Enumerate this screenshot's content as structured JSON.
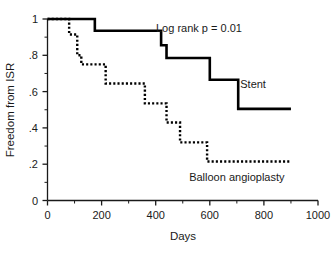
{
  "chart_data": {
    "type": "line",
    "subtype": "kaplan-meier-step",
    "title": "",
    "xlabel": "Days",
    "ylabel": "Freedom from ISR",
    "xlim": [
      0,
      1000
    ],
    "ylim": [
      0,
      1
    ],
    "grid": false,
    "legend_position": "inline-annotation",
    "xticks": [
      0,
      200,
      400,
      600,
      800,
      1000
    ],
    "xtick_labels": [
      "0",
      "200",
      "400",
      "600",
      "800",
      "1000"
    ],
    "xminor_ticks": [
      100,
      300,
      500,
      700,
      900
    ],
    "yticks": [
      0,
      0.2,
      0.4,
      0.6,
      0.8,
      1
    ],
    "ytick_labels": [
      "0",
      ".2",
      ".4",
      ".6",
      ".8",
      "1"
    ],
    "yminor_ticks": [
      0.1,
      0.3,
      0.5,
      0.7,
      0.9
    ],
    "annotations": [
      {
        "name": "log-rank-p",
        "text": "Log rank p = 0.01",
        "x": 560,
        "y": 0.93
      },
      {
        "name": "stent-label",
        "text": "Stent",
        "x": 760,
        "y": 0.62
      },
      {
        "name": "balloon-label",
        "text": "Balloon angioplasty",
        "x": 700,
        "y": 0.11
      }
    ],
    "series": [
      {
        "name": "Stent",
        "style": "solid",
        "color": "#000000",
        "points": [
          {
            "x": 0,
            "y": 1.0
          },
          {
            "x": 175,
            "y": 1.0
          },
          {
            "x": 175,
            "y": 0.935
          },
          {
            "x": 420,
            "y": 0.935
          },
          {
            "x": 420,
            "y": 0.855
          },
          {
            "x": 440,
            "y": 0.855
          },
          {
            "x": 440,
            "y": 0.785
          },
          {
            "x": 600,
            "y": 0.785
          },
          {
            "x": 600,
            "y": 0.665
          },
          {
            "x": 705,
            "y": 0.665
          },
          {
            "x": 705,
            "y": 0.505
          },
          {
            "x": 900,
            "y": 0.505
          }
        ]
      },
      {
        "name": "Balloon angioplasty",
        "style": "dotted",
        "color": "#000000",
        "points": [
          {
            "x": 0,
            "y": 1.0
          },
          {
            "x": 80,
            "y": 1.0
          },
          {
            "x": 80,
            "y": 0.915
          },
          {
            "x": 110,
            "y": 0.915
          },
          {
            "x": 110,
            "y": 0.8
          },
          {
            "x": 125,
            "y": 0.8
          },
          {
            "x": 125,
            "y": 0.75
          },
          {
            "x": 215,
            "y": 0.75
          },
          {
            "x": 215,
            "y": 0.645
          },
          {
            "x": 360,
            "y": 0.645
          },
          {
            "x": 360,
            "y": 0.535
          },
          {
            "x": 440,
            "y": 0.535
          },
          {
            "x": 440,
            "y": 0.43
          },
          {
            "x": 490,
            "y": 0.43
          },
          {
            "x": 490,
            "y": 0.32
          },
          {
            "x": 590,
            "y": 0.32
          },
          {
            "x": 590,
            "y": 0.215
          },
          {
            "x": 900,
            "y": 0.215
          }
        ]
      }
    ]
  }
}
